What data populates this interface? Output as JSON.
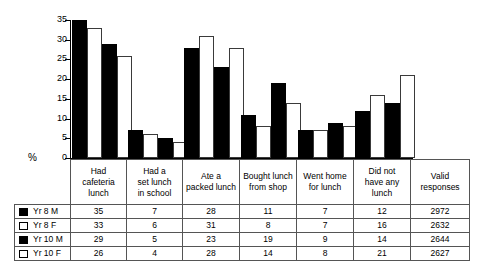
{
  "chart_data": {
    "type": "bar",
    "title": "",
    "xlabel": "",
    "ylabel": "%",
    "ylim": [
      0,
      35
    ],
    "yticks": [
      0,
      5,
      10,
      15,
      20,
      25,
      30,
      35
    ],
    "grid": false,
    "legend_position": "table-left",
    "categories": [
      "Had cafeteria lunch",
      "Had a set lunch in school",
      "Ate a packed lunch",
      "Bought lunch from shop",
      "Went home for lunch",
      "Did not have any lunch"
    ],
    "series": [
      {
        "name": "Yr 8 M",
        "swatch": "black",
        "values": [
          35,
          7,
          28,
          11,
          7,
          12
        ],
        "valid_responses": 2972
      },
      {
        "name": "Yr 8 F",
        "swatch": "white",
        "values": [
          33,
          6,
          31,
          8,
          7,
          16
        ],
        "valid_responses": 2632
      },
      {
        "name": "Yr 10 M",
        "swatch": "black",
        "values": [
          29,
          5,
          23,
          19,
          9,
          14
        ],
        "valid_responses": 2644
      },
      {
        "name": "Yr 10 F",
        "swatch": "white",
        "values": [
          26,
          4,
          28,
          14,
          8,
          21
        ],
        "valid_responses": 2627
      }
    ],
    "colors": {
      "black_series": "#000000",
      "white_series": "#ffffff",
      "outline": "#3a3a3a"
    }
  },
  "axis": {
    "percent_symbol": "%",
    "tick_labels": [
      "0",
      "5",
      "10",
      "15",
      "20",
      "25",
      "30",
      "35"
    ]
  },
  "table": {
    "column_headers": [
      "Had cafeteria lunch",
      "Had a set lunch in school",
      "Ate a packed lunch",
      "Bought lunch from shop",
      "Went home for lunch",
      "Did not have any lunch",
      "Valid responses"
    ],
    "column_header_lines": [
      [
        "Had",
        "cafeteria",
        "lunch"
      ],
      [
        "Had a",
        "set lunch",
        "in school"
      ],
      [
        "Ate a",
        "packed lunch"
      ],
      [
        "Bought lunch",
        "from shop"
      ],
      [
        "Went home",
        "for lunch"
      ],
      [
        "Did not",
        "have any",
        "lunch"
      ],
      [
        "Valid",
        "responses"
      ]
    ],
    "rows": [
      {
        "label": "Yr 8 M",
        "swatch": "black",
        "cells": [
          "35",
          "7",
          "28",
          "11",
          "7",
          "12",
          "2972"
        ]
      },
      {
        "label": "Yr 8 F",
        "swatch": "white",
        "cells": [
          "33",
          "6",
          "31",
          "8",
          "7",
          "16",
          "2632"
        ]
      },
      {
        "label": "Yr 10 M",
        "swatch": "black",
        "cells": [
          "29",
          "5",
          "23",
          "19",
          "9",
          "14",
          "2644"
        ]
      },
      {
        "label": "Yr 10 F",
        "swatch": "white",
        "cells": [
          "26",
          "4",
          "28",
          "14",
          "8",
          "21",
          "2627"
        ]
      }
    ]
  }
}
